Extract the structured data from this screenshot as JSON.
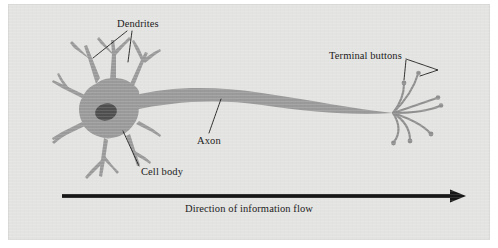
{
  "figure": {
    "type": "neuron-anatomy-diagram",
    "panel": {
      "background_color": "#e3e3e1",
      "outer_margin_color": "#ffffff"
    },
    "colors": {
      "cell_fill": "#9a9a9a",
      "cell_stroke": "#8e8e8e",
      "nucleus_fill": "#4a4a4a",
      "axon_fill": "#9a9a9a",
      "terminal_stroke": "#8f8f8f",
      "leader_line": "#1c1c1c",
      "arrow": "#161616",
      "text": "#1c1c1c"
    },
    "labels": {
      "dendrites": "Dendrites",
      "terminal_buttons": "Terminal buttons",
      "axon": "Axon",
      "cell_body": "Cell body",
      "flow_caption": "Direction of information flow"
    },
    "arrow": {
      "direction": "left-to-right",
      "start_x": 62,
      "end_x": 464,
      "y": 196,
      "thickness": 4
    },
    "parts": [
      {
        "name": "dendrites",
        "description": "branching tapered processes radiating from the soma"
      },
      {
        "name": "cell body",
        "description": "star-shaped soma containing the nucleus"
      },
      {
        "name": "nucleus",
        "description": "dark ellipse inside the cell body"
      },
      {
        "name": "axon",
        "description": "long tapering process extending to the right"
      },
      {
        "name": "terminal buttons",
        "description": "fanned terminal branches ending in small knobs"
      }
    ]
  }
}
